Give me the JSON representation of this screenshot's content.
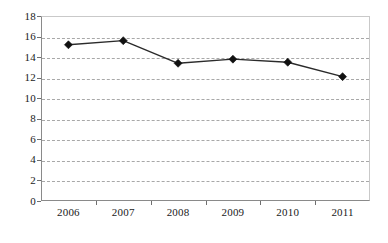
{
  "chart_data": {
    "type": "line",
    "title": "",
    "subtitle": "",
    "xlabel": "",
    "ylabel": "",
    "categories": [
      "2006",
      "2007",
      "2008",
      "2009",
      "2010",
      "2011"
    ],
    "values": [
      15.2,
      15.6,
      13.4,
      13.8,
      13.5,
      12.1
    ],
    "series": [
      {
        "name": "",
        "values": [
          15.2,
          15.6,
          13.4,
          13.8,
          13.5,
          12.1
        ]
      }
    ],
    "ylim": [
      0,
      18
    ],
    "ytick_step": 2,
    "yticks": [
      0,
      2,
      4,
      6,
      8,
      10,
      12,
      14,
      16,
      18
    ],
    "ytick_labels": [
      "0",
      "2",
      "4",
      "6",
      "8",
      "10",
      "12",
      "14",
      "16",
      "18"
    ],
    "xticks": [
      "2006",
      "2007",
      "2008",
      "2009",
      "2010",
      "2011"
    ],
    "grid": {
      "horizontal": true,
      "vertical": false,
      "style": "dashed"
    },
    "legend": {
      "visible": false,
      "position": "none",
      "entries": []
    },
    "marker": "diamond",
    "annotations": [],
    "colors": {
      "line": "#2b2b2b",
      "marker": "#111111",
      "gridline": "#a8a8a8",
      "axis": "#8a8a8a",
      "frame": "#c9c9c9",
      "background": "#ffffff",
      "text": "#1a1a1a"
    }
  }
}
